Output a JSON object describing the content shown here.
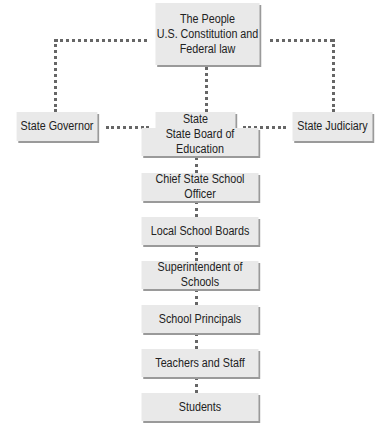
{
  "diagram": {
    "top": {
      "lines": [
        "The People",
        "U.S. Constitution and",
        "Federal law"
      ]
    },
    "branches": {
      "governor": "State Governor",
      "legislature": "State Legislature",
      "judiciary": "State Judiciary"
    },
    "chain": [
      "State Board of Education",
      "Chief State School Officer",
      "Local School Boards",
      "Superintendent of Schools",
      "School Principals",
      "Teachers and Staff",
      "Students"
    ],
    "colors": {
      "box": "#e9e9e9",
      "shadow": "#9a9a9a",
      "connector": "#666666"
    }
  }
}
